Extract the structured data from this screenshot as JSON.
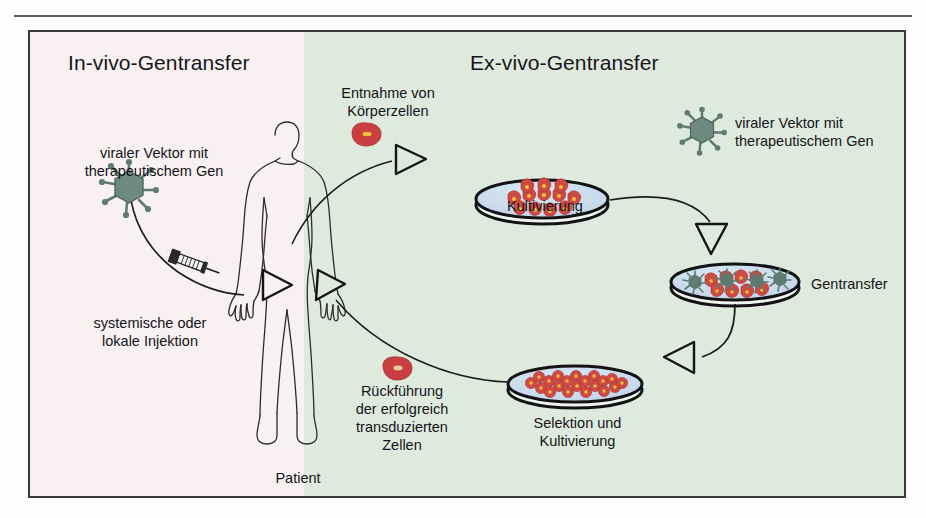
{
  "figure": {
    "panels": {
      "invivo": {
        "title": "In-vivo-Gentransfer",
        "bg_color": "#f8f0f1"
      },
      "exvivo": {
        "title": "Ex-vivo-Gentransfer",
        "bg_color": "#dfeade"
      }
    },
    "labels": {
      "viral_vector_left": "viraler Vektor mit\ntherapeutischem Gen",
      "injection": "systemische oder\nlokale Injektion",
      "patient": "Patient",
      "cell_harvest": "Entnahme von\nKörperzellen",
      "cultivation": "Kultivierung",
      "viral_vector_right": "viraler Vektor mit\ntherapeutischem Gen",
      "gene_transfer": "Gentransfer",
      "selection_cultivation": "Selektion und\nKultivierung",
      "reinfusion": "Rückführung\nder erfolgreich\ntransduzierten\nZellen"
    },
    "icons": {
      "virus_left": "virus-particle-icon",
      "virus_right": "virus-particle-icon",
      "syringe": "syringe-icon",
      "human": "human-body-outline-icon",
      "cell_harvested": "body-cell-icon",
      "cell_reinfused": "transduced-cell-icon",
      "dish_cultivation": "petri-dish-icon",
      "dish_gene_transfer": "petri-dish-icon",
      "dish_selection": "petri-dish-icon"
    },
    "colors": {
      "virus": "#5e7a71",
      "cell_red": "#cf3f42",
      "cell_nucleus": "#f2c23a",
      "dish_medium": "#c5d8ea",
      "outline": "#16161a",
      "frame": "#3a3a3a"
    }
  }
}
